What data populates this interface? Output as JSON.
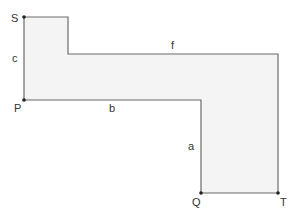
{
  "diagram": {
    "shape": "L-shaped polygon",
    "colors": {
      "stroke": "#6b6b6b",
      "fill": "#f4f4f4",
      "vertex": "#222222",
      "label": "#333333"
    },
    "vertices": [
      {
        "id": "S",
        "label": "S",
        "x": 24,
        "y": 17
      },
      {
        "id": "P",
        "label": "P",
        "x": 24,
        "y": 100
      },
      {
        "id": "Q",
        "label": "Q",
        "x": 201,
        "y": 193
      },
      {
        "id": "T",
        "label": "T",
        "x": 278,
        "y": 193
      }
    ],
    "edges": [
      {
        "id": "c",
        "label": "c"
      },
      {
        "id": "b",
        "label": "b"
      },
      {
        "id": "f",
        "label": "f"
      },
      {
        "id": "a",
        "label": "a"
      }
    ]
  }
}
